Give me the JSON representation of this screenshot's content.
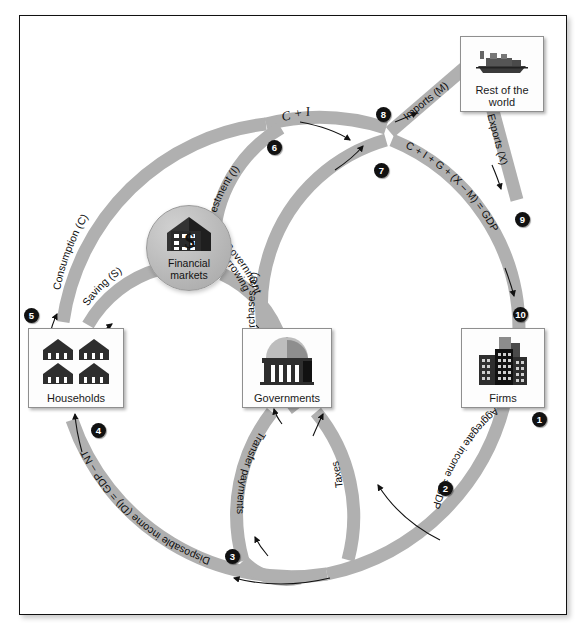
{
  "diagram": {
    "band_color": "#b0b0b0",
    "marker_color": "#111111",
    "nodes": [
      {
        "id": "households",
        "label": "Households",
        "icon": "houses-icon"
      },
      {
        "id": "governments",
        "label": "Governments",
        "icon": "capitol-building-icon"
      },
      {
        "id": "firms",
        "label": "Firms",
        "icon": "office-buildings-icon"
      },
      {
        "id": "rest_of_world",
        "label_line1": "Rest of the",
        "label_line2": "world",
        "icon": "cargo-ship-icon"
      },
      {
        "id": "financial",
        "label_line1": "Financial",
        "label_line2": "markets",
        "icon": "bank-dollar-icon"
      }
    ],
    "flows": [
      {
        "id": "aggregate_income",
        "label": "Aggregate income = GDP"
      },
      {
        "id": "taxes",
        "label": "Taxes"
      },
      {
        "id": "disposable_income",
        "label": "Disposable income (DI) = GDP – NT"
      },
      {
        "id": "transfer_payments",
        "label": "Transfer payments"
      },
      {
        "id": "consumption",
        "label": "Consumption (C)"
      },
      {
        "id": "saving",
        "label": "Saving (S)"
      },
      {
        "id": "investment",
        "label": "Investment (I)"
      },
      {
        "id": "gov_borrowing_l1",
        "label": "Government"
      },
      {
        "id": "gov_borrowing_l2",
        "label": "borrowing"
      },
      {
        "id": "gov_purchases",
        "label": "Government purchases (G)"
      },
      {
        "id": "c_plus_i",
        "label": "C + I"
      },
      {
        "id": "imports",
        "label": "Imports (M)"
      },
      {
        "id": "exports",
        "label": "Exports (X)"
      },
      {
        "id": "gdp_expenditure",
        "label": "C + I + G + (X – M) = GDP"
      }
    ],
    "markers": [
      {
        "n": "1",
        "x": 532,
        "y": 412
      },
      {
        "n": "2",
        "x": 438,
        "y": 481
      },
      {
        "n": "3",
        "x": 225,
        "y": 549
      },
      {
        "n": "4",
        "x": 91,
        "y": 423
      },
      {
        "n": "5",
        "x": 24,
        "y": 308
      },
      {
        "n": "6",
        "x": 267,
        "y": 140
      },
      {
        "n": "7",
        "x": 374,
        "y": 163
      },
      {
        "n": "8",
        "x": 376,
        "y": 107
      },
      {
        "n": "9",
        "x": 515,
        "y": 212
      },
      {
        "n": "10",
        "x": 513,
        "y": 307
      }
    ]
  }
}
